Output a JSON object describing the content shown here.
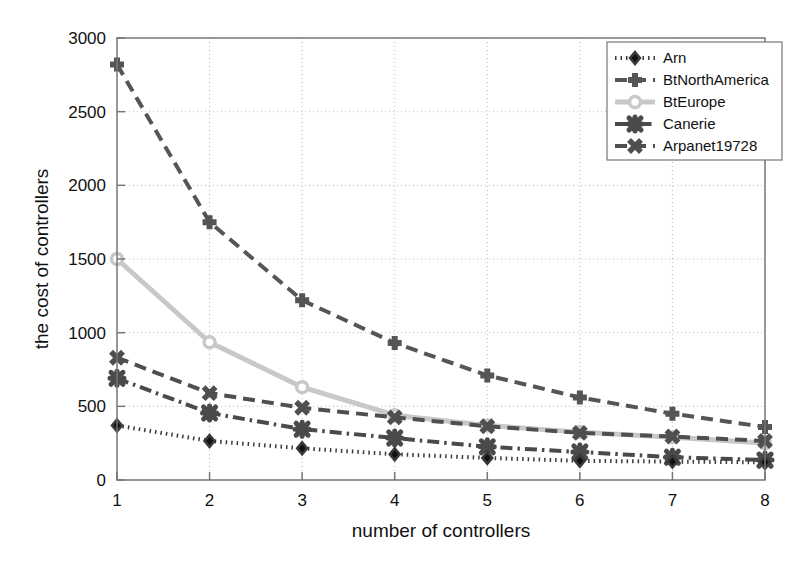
{
  "chart_data": {
    "type": "line",
    "title": "",
    "xlabel": "number of controllers",
    "ylabel": "the cost of controllers",
    "x": [
      1,
      2,
      3,
      4,
      5,
      6,
      7,
      8
    ],
    "xlim": [
      1,
      8
    ],
    "ylim": [
      0,
      3000
    ],
    "xticks": [
      "1",
      "2",
      "3",
      "4",
      "5",
      "6",
      "7",
      "8"
    ],
    "yticks": [
      "0",
      "500",
      "1000",
      "1500",
      "2000",
      "2500",
      "3000"
    ],
    "grid": true,
    "legend_position": "top-right",
    "series": [
      {
        "name": "Arn",
        "values": [
          370,
          265,
          215,
          175,
          150,
          130,
          125,
          120
        ],
        "color": "#3a3a3a",
        "marker": "diamond",
        "linestyle": "dotted"
      },
      {
        "name": "BtNorthAmerica",
        "values": [
          2820,
          1750,
          1220,
          930,
          710,
          560,
          450,
          360
        ],
        "color": "#555555",
        "marker": "plus",
        "linestyle": "dashed"
      },
      {
        "name": "BtEurope",
        "values": [
          1500,
          935,
          630,
          440,
          370,
          325,
          290,
          250
        ],
        "color": "#c8c8c8",
        "marker": "circle",
        "linestyle": "solid"
      },
      {
        "name": "Canerie",
        "values": [
          690,
          455,
          345,
          285,
          225,
          190,
          155,
          135
        ],
        "color": "#4a4a4a",
        "marker": "hexagram",
        "linestyle": "dashdot"
      },
      {
        "name": "Arpanet19728",
        "values": [
          830,
          590,
          490,
          425,
          365,
          320,
          295,
          265
        ],
        "color": "#4f4f4f",
        "marker": "xcross",
        "linestyle": "dashed"
      }
    ]
  },
  "axes": {
    "frame_color": "#777777",
    "grid_color": "#bbbbbb",
    "background": "#ffffff"
  },
  "legend": {
    "items": [
      {
        "label": "Arn"
      },
      {
        "label": "BtNorthAmerica"
      },
      {
        "label": "BtEurope"
      },
      {
        "label": "Canerie"
      },
      {
        "label": "Arpanet19728"
      }
    ]
  }
}
